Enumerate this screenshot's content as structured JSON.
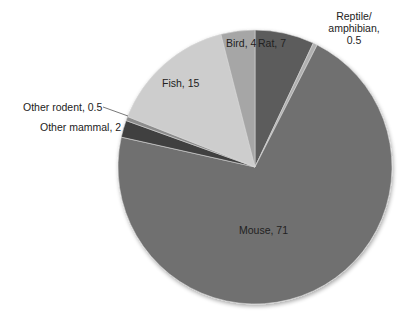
{
  "chart_data": {
    "type": "pie",
    "title": "",
    "start_angle_deg": 0,
    "direction": "clockwise",
    "slices": [
      {
        "label": "Rat",
        "value": 7,
        "text": "Rat, 7",
        "color": "#5c5c5c"
      },
      {
        "label": "Reptile/amphibian",
        "value": 0.5,
        "text": "Reptile/ amphibian, 0.5",
        "color": "#b0b0b0"
      },
      {
        "label": "Mouse",
        "value": 71,
        "text": "Mouse, 71",
        "color": "#6f6f6f"
      },
      {
        "label": "Other mammal",
        "value": 2,
        "text": "Other mammal, 2",
        "color": "#3f3f3f"
      },
      {
        "label": "Other rodent",
        "value": 0.5,
        "text": "Other rodent, 0.5",
        "color": "#8c8c8c"
      },
      {
        "label": "Fish",
        "value": 15,
        "text": "Fish, 15",
        "color": "#cdcdcd"
      },
      {
        "label": "Bird",
        "value": 4,
        "text": "Bird, 4",
        "color": "#a6a6a6"
      }
    ],
    "categories": [
      "Rat",
      "Reptile/amphibian",
      "Mouse",
      "Other mammal",
      "Other rodent",
      "Fish",
      "Bird"
    ],
    "values": [
      7,
      0.5,
      71,
      2,
      0.5,
      15,
      4
    ],
    "legend": "none (data labels on/near slices)"
  },
  "labels": {
    "rat": "Rat, 7",
    "reptile_line1": "Reptile/",
    "reptile_line2": "amphibian,",
    "reptile_line3": "0.5",
    "mouse": "Mouse, 71",
    "other_mammal": "Other mammal, 2",
    "other_rodent": "Other rodent, 0.5",
    "fish": "Fish, 15",
    "bird": "Bird, 4"
  }
}
